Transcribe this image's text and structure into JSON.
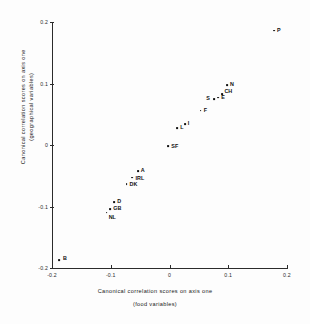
{
  "chart_data": {
    "type": "scatter",
    "title": "",
    "xlabel": "Canonical correlation scores on axis one",
    "xlabel_sub": "(food variables)",
    "ylabel": "Canonical correlation scores on axis one",
    "ylabel_sub": "(geographical variables)",
    "xlim": [
      -0.2,
      0.2
    ],
    "ylim": [
      -0.2,
      0.2
    ],
    "xticks": [
      "-0.2",
      "-0.1",
      "0",
      "0.1",
      "0.2"
    ],
    "xtick_values": [
      -0.2,
      -0.1,
      0,
      0.1,
      0.2
    ],
    "yticks": [
      "-0.2",
      "-0.1",
      "0",
      "0.1",
      "0.2"
    ],
    "ytick_values": [
      -0.2,
      -0.1,
      0,
      0.1,
      0.2
    ],
    "grid": false,
    "legend": "none",
    "marker_color": "#111111",
    "axis_color": "#2b2b2b",
    "points": [
      {
        "label": "B",
        "x": -0.188,
        "y": -0.187,
        "lx": 4,
        "ly": -5
      },
      {
        "label": "NL",
        "x": -0.107,
        "y": -0.11,
        "lx": 2,
        "ly": 1
      },
      {
        "label": "GB",
        "x": -0.101,
        "y": -0.104,
        "lx": 3,
        "ly": -4
      },
      {
        "label": "D",
        "x": -0.094,
        "y": -0.093,
        "lx": 3,
        "ly": -4
      },
      {
        "label": "DK",
        "x": -0.073,
        "y": -0.063,
        "lx": 3,
        "ly": -3
      },
      {
        "label": "IRL",
        "x": -0.063,
        "y": -0.053,
        "lx": 3,
        "ly": -3
      },
      {
        "label": "A",
        "x": -0.054,
        "y": -0.042,
        "lx": 3,
        "ly": -4
      },
      {
        "label": "SF",
        "x": -0.002,
        "y": -0.002,
        "lx": 3,
        "ly": -3
      },
      {
        "label": "L",
        "x": 0.013,
        "y": 0.027,
        "lx": 3,
        "ly": -4
      },
      {
        "label": "I",
        "x": 0.026,
        "y": 0.034,
        "lx": 3,
        "ly": -4
      },
      {
        "label": "F",
        "x": 0.053,
        "y": 0.056,
        "lx": 3,
        "ly": -4
      },
      {
        "label": "S",
        "x": 0.076,
        "y": 0.075,
        "lx": -8,
        "ly": -4
      },
      {
        "label": "E",
        "x": 0.083,
        "y": 0.077,
        "lx": 3,
        "ly": -4
      },
      {
        "label": "CH",
        "x": 0.09,
        "y": 0.083,
        "lx": 2,
        "ly": -6
      },
      {
        "label": "N",
        "x": 0.098,
        "y": 0.098,
        "lx": 3,
        "ly": -4
      },
      {
        "label": "P",
        "x": 0.178,
        "y": 0.186,
        "lx": 3,
        "ly": -4
      }
    ]
  }
}
